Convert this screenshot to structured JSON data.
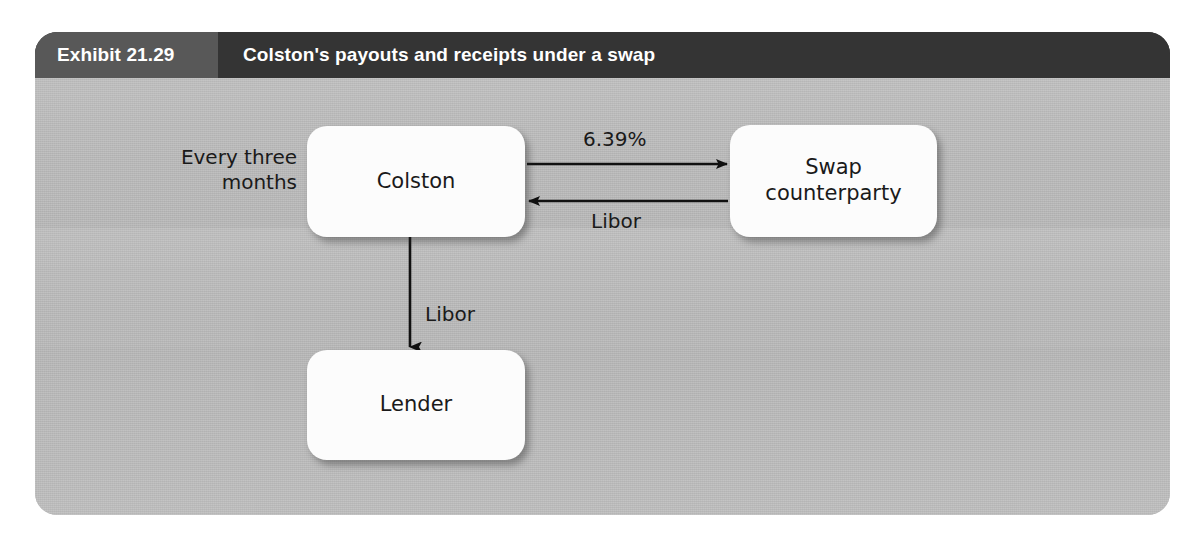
{
  "exhibit": {
    "number": "Exhibit 21.29",
    "title": "Colston's payouts and receipts under a swap",
    "header_bg": "#343434",
    "number_bg": "#585858",
    "body_bg": "#b9b9b9"
  },
  "diagram": {
    "type": "flow-diagram",
    "frequency_note": {
      "line1": "Every three",
      "line2": "months"
    },
    "nodes": [
      {
        "id": "colston",
        "label": "Colston"
      },
      {
        "id": "counterparty",
        "label_line1": "Swap",
        "label_line2": "counterparty"
      },
      {
        "id": "lender",
        "label": "Lender"
      }
    ],
    "edges": [
      {
        "id": "colston-pays-fixed",
        "from": "colston",
        "to": "counterparty",
        "direction": "right",
        "label": "6.39%"
      },
      {
        "id": "counterparty-pays-floating",
        "from": "counterparty",
        "to": "colston",
        "direction": "left",
        "label": "Libor"
      },
      {
        "id": "colston-pays-lender",
        "from": "colston",
        "to": "lender",
        "direction": "down",
        "label": "Libor"
      }
    ],
    "node_fill": "#fcfcfc",
    "arrow_color": "#111111"
  }
}
